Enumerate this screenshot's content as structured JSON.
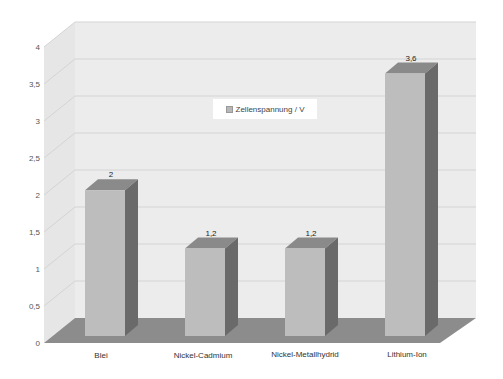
{
  "chart_data": {
    "type": "bar",
    "style": "3d-column",
    "title": "",
    "xlabel": "",
    "ylabel": "",
    "categories": [
      "Blei",
      "Nickel-Cadmium",
      "Nickel-Metallhydrid",
      "Lithium-Ion"
    ],
    "series": [
      {
        "name": "Zellenspannung / V",
        "values": [
          2,
          1.2,
          1.2,
          3.6
        ]
      }
    ],
    "value_labels": [
      "2",
      "1,2",
      "1,2",
      "3,6"
    ],
    "y_ticks": [
      "0",
      "0,5",
      "1",
      "1,5",
      "2",
      "2,5",
      "3",
      "3,5",
      "4"
    ],
    "ylim": [
      0,
      4
    ],
    "grid": true,
    "legend_position": "inside-top-center",
    "colors": {
      "bar_front": "#bdbdbd",
      "bar_side": "#6a6a6a",
      "bar_top": "#8a8a8a",
      "floor": "#8c8c8c",
      "wall": "#ececec",
      "grid": "#d4d4d4"
    }
  },
  "legend": {
    "label": "Zellenspannung / V"
  }
}
